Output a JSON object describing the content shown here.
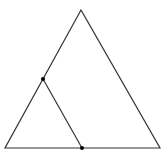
{
  "diagram": {
    "type": "geometry",
    "stroke_color": "#333333",
    "point_color": "#000000",
    "outer_triangle": {
      "apex": [
        81,
        10
      ],
      "bottom_left": [
        5,
        148
      ],
      "bottom_right": [
        160,
        148
      ]
    },
    "inner_segment": {
      "from": [
        43,
        79
      ],
      "to": [
        82,
        148
      ]
    },
    "points": [
      {
        "name": "point-on-left-side",
        "x": 43,
        "y": 79
      },
      {
        "name": "point-on-base",
        "x": 82,
        "y": 148
      }
    ]
  }
}
